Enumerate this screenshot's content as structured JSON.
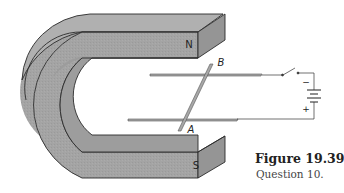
{
  "figure": {
    "number_label": "Figure 19.39",
    "caption": "Question 10."
  },
  "magnet": {
    "north_label": "N",
    "south_label": "S",
    "fill_color": "#a3a3a3",
    "edge_color": "#2b2b2b"
  },
  "rails": {
    "rod_end_top_label": "B",
    "rod_end_bottom_label": "A"
  },
  "battery": {
    "negative_label": "−",
    "positive_label": "+"
  }
}
